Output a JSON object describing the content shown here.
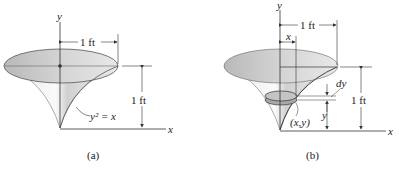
{
  "figure_a": {
    "caption": "(a)",
    "axis_x": "x",
    "axis_y": "y",
    "top_dimension": "1 ft",
    "height_dimension": "1 ft",
    "curve_label": "y² = x"
  },
  "figure_b": {
    "caption": "(b)",
    "axis_x": "x",
    "axis_y": "y",
    "top_dimension": "1 ft",
    "radius_label": "x",
    "thickness_label": "dy",
    "point_label": "(x,y)",
    "y_label": "y",
    "height_dimension": "1 ft"
  },
  "colors": {
    "surface_light": "#f2f2f2",
    "surface_mid": "#cfcfcf",
    "top_ellipse": "#c8c8c8",
    "disk": "#9a9a9a",
    "line": "#333333"
  }
}
